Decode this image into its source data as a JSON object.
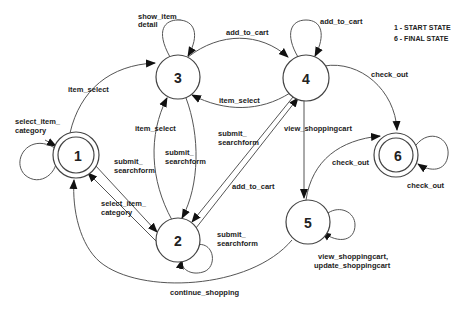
{
  "diagram": {
    "type": "state-transition-diagram",
    "legend": {
      "start": "1 - START STATE",
      "final": "6 - FINAL STATE"
    },
    "nodes": [
      {
        "id": "1",
        "label": "1",
        "kind": "start"
      },
      {
        "id": "2",
        "label": "2",
        "kind": "normal"
      },
      {
        "id": "3",
        "label": "3",
        "kind": "normal"
      },
      {
        "id": "4",
        "label": "4",
        "kind": "normal"
      },
      {
        "id": "5",
        "label": "5",
        "kind": "normal"
      },
      {
        "id": "6",
        "label": "6",
        "kind": "final"
      }
    ],
    "edges": [
      {
        "from": "1",
        "to": "1",
        "label_l1": "select_item_",
        "label_l2": "category"
      },
      {
        "from": "1",
        "to": "3",
        "label_l1": "item_select",
        "label_l2": ""
      },
      {
        "from": "1",
        "to": "2",
        "label_l1": "submit_",
        "label_l2": "searchform"
      },
      {
        "from": "2",
        "to": "1",
        "label_l1": "select_item_",
        "label_l2": "category"
      },
      {
        "from": "3",
        "to": "3",
        "label_l1": "show_item_",
        "label_l2": "detail"
      },
      {
        "from": "3",
        "to": "4",
        "label_l1": "add_to_cart",
        "label_l2": ""
      },
      {
        "from": "4",
        "to": "3",
        "label_l1": "item_select",
        "label_l2": ""
      },
      {
        "from": "2",
        "to": "3",
        "label_l1": "item_select",
        "label_l2": ""
      },
      {
        "from": "3",
        "to": "2",
        "label_l1": "submit_",
        "label_l2": "searchform"
      },
      {
        "from": "4",
        "to": "2",
        "label_l1": "submit_",
        "label_l2": "searchform"
      },
      {
        "from": "2",
        "to": "4",
        "label_l1": "add_to_cart",
        "label_l2": ""
      },
      {
        "from": "2",
        "to": "2",
        "label_l1": "submit_",
        "label_l2": "searchform"
      },
      {
        "from": "4",
        "to": "4",
        "label_l1": "add_to_cart",
        "label_l2": ""
      },
      {
        "from": "4",
        "to": "6",
        "label_l1": "check_out",
        "label_l2": ""
      },
      {
        "from": "4",
        "to": "5",
        "label_l1": "view_shoppingcart",
        "label_l2": ""
      },
      {
        "from": "5",
        "to": "6",
        "label_l1": "check_out",
        "label_l2": ""
      },
      {
        "from": "6",
        "to": "6",
        "label_l1": "check_out",
        "label_l2": ""
      },
      {
        "from": "5",
        "to": "5",
        "label_l1": "view_shoppingcart,",
        "label_l2": "update_shoppingcart"
      },
      {
        "from": "5",
        "to": "1",
        "label_l1": "continue_shopping",
        "label_l2": ""
      }
    ]
  }
}
